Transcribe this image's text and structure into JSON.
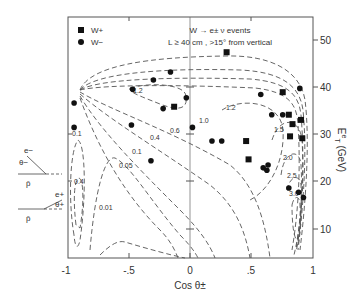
{
  "chart_data": {
    "type": "scatter",
    "title": "W → e± ν events",
    "subtitle": "L ≥ 40 cm , >15° from vertical",
    "xlabel": "Cos θ±",
    "ylabel": "E_T^e (GeV)",
    "xlim": [
      -1,
      1
    ],
    "ylim": [
      3.6,
      52.5
    ],
    "x_ticks": [
      "-1",
      "-.5",
      "0",
      ".5",
      "1"
    ],
    "y_ticks": [
      "10",
      "20",
      "30",
      "40",
      "50"
    ],
    "legend": [
      {
        "label": "W+",
        "marker": "square"
      },
      {
        "label": "W−",
        "marker": "circle"
      }
    ],
    "legend_position": "upper-left",
    "grid": false,
    "series": [
      {
        "name": "W+",
        "marker": "square",
        "points": [
          [
            0.3,
            47.4
          ],
          [
            -0.13,
            35.8
          ],
          [
            0.76,
            38.9
          ],
          [
            0.81,
            34.1
          ],
          [
            0.84,
            32.1
          ],
          [
            0.92,
            29.1
          ],
          [
            0.46,
            28.5
          ],
          [
            0.48,
            24.6
          ],
          [
            0.82,
            29.5
          ],
          [
            0.91,
            33.0
          ]
        ]
      },
      {
        "name": "W−",
        "marker": "circle",
        "points": [
          [
            -0.16,
            43.2
          ],
          [
            -0.3,
            41.5
          ],
          [
            -0.47,
            39.5
          ],
          [
            -0.03,
            37.7
          ],
          [
            -0.95,
            36.6
          ],
          [
            -0.95,
            31.4
          ],
          [
            -0.48,
            31.9
          ],
          [
            -0.22,
            35.4
          ],
          [
            0.58,
            38.4
          ],
          [
            0.67,
            34.1
          ],
          [
            0.76,
            34.1
          ],
          [
            0.9,
            39.7
          ],
          [
            -0.32,
            24.3
          ],
          [
            0.02,
            31.4
          ],
          [
            0.18,
            28.5
          ],
          [
            0.26,
            28.5
          ],
          [
            0.6,
            22.8
          ],
          [
            0.63,
            22.3
          ],
          [
            0.64,
            23.4
          ],
          [
            0.81,
            18.5
          ],
          [
            0.89,
            17.6
          ],
          [
            0.93,
            16.5
          ]
        ]
      }
    ],
    "contours": {
      "levels": [
        "0.01",
        "0.05",
        "0.1",
        "0.4",
        "0.6",
        "1.0",
        "1.2",
        "1.5",
        "2.0",
        "2.5",
        "3.0",
        "0.1",
        "0.4",
        "1.2"
      ],
      "style": "dashed"
    },
    "inset": {
      "top": {
        "particle": "e−",
        "angle": "θ−",
        "beam": "p̄"
      },
      "bottom": {
        "particle": "e+",
        "angle": "θ+",
        "beam": "p̄"
      }
    }
  }
}
